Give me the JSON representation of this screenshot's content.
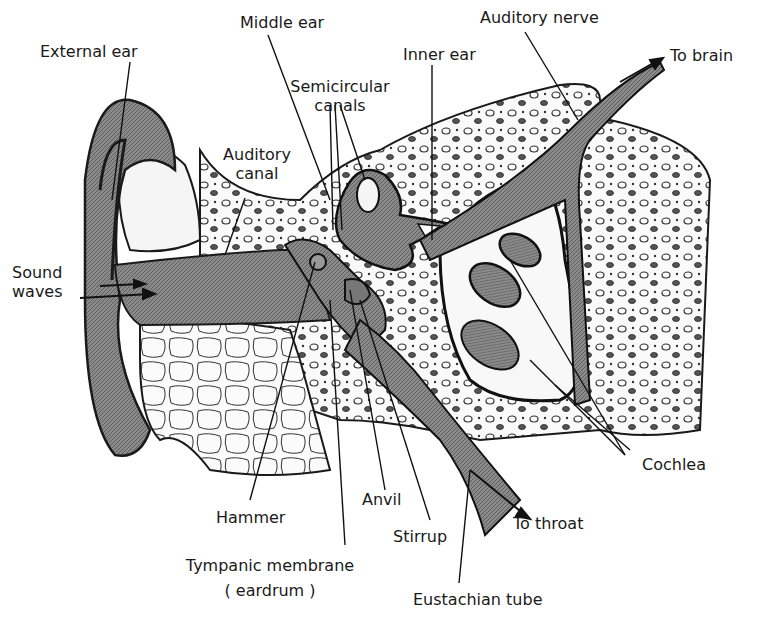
{
  "diagram": {
    "colors": {
      "ink": "#1a1a1a",
      "tissue": "#7a7a7a",
      "bone_fill": "#f4f4f4",
      "background": "#ffffff"
    },
    "labels": {
      "external_ear": "External ear",
      "middle_ear": "Middle ear",
      "auditory_nerve": "Auditory nerve",
      "inner_ear": "Inner ear",
      "to_brain": "To brain",
      "semicircular_1": "Semicircular",
      "semicircular_2": "canals",
      "auditory_canal_1": "Auditory",
      "auditory_canal_2": "canal",
      "sound_waves_1": "Sound",
      "sound_waves_2": "waves",
      "cochlea": "Cochlea",
      "anvil": "Anvil",
      "hammer": "Hammer",
      "stirrup": "Stirrup",
      "to_throat": "To throat",
      "tympanic_1": "Tympanic membrane",
      "tympanic_2": "( eardrum )",
      "eustachian": "Eustachian tube"
    }
  }
}
